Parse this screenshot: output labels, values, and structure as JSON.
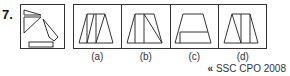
{
  "question": {
    "number": "7.",
    "figure": "question-figure: trapezoid pieces (two triangles, a slanted quadrilateral/triangle, and a rectangle)"
  },
  "options": [
    {
      "label": "(a)",
      "figure": "trapezoid divided by two slanted parallel lines"
    },
    {
      "label": "(b)",
      "figure": "trapezoid with vertical line and diagonal line"
    },
    {
      "label": "(c)",
      "figure": "trapezoid with vertical line at left and horizontal line near bottom"
    },
    {
      "label": "(d)",
      "figure": "trapezoid with diagonal and two vertical lines"
    }
  ],
  "source": {
    "arrow": "«",
    "text": "SSC CPO 2008"
  }
}
